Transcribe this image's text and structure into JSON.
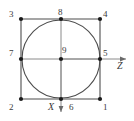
{
  "figure": {
    "colors": {
      "line": "#4d4d4d",
      "node": "#1a1a1a",
      "circle": "#4d4d4d",
      "text": "#3a3a3a",
      "background": "#ffffff"
    },
    "geometry": {
      "square": {
        "left": 21,
        "top": 19,
        "right": 100,
        "bottom": 99
      },
      "circle": {
        "cx": 61,
        "cy": 59,
        "r": 39
      },
      "center": {
        "x": 61,
        "y": 59
      }
    },
    "nodes": [
      {
        "id": "1",
        "label": "1",
        "x": 100,
        "y": 99,
        "label_x": 103,
        "label_y": 103
      },
      {
        "id": "2",
        "label": "2",
        "x": 21,
        "y": 99,
        "label_x": 9,
        "label_y": 103
      },
      {
        "id": "3",
        "label": "3",
        "x": 21,
        "y": 19,
        "label_x": 9,
        "label_y": 10
      },
      {
        "id": "4",
        "label": "4",
        "x": 100,
        "y": 19,
        "label_x": 103,
        "label_y": 10
      },
      {
        "id": "5",
        "label": "5",
        "x": 100,
        "y": 59,
        "label_x": 103,
        "label_y": 48
      },
      {
        "id": "6",
        "label": "6",
        "x": 61,
        "y": 99,
        "label_x": 69,
        "label_y": 103
      },
      {
        "id": "7",
        "label": "7",
        "x": 21,
        "y": 59,
        "label_x": 9,
        "label_y": 48
      },
      {
        "id": "8",
        "label": "8",
        "x": 61,
        "y": 19,
        "label_x": 58,
        "label_y": 8
      },
      {
        "id": "9",
        "label": "9",
        "x": 61,
        "y": 59,
        "label_x": 62,
        "label_y": 47
      }
    ],
    "axes": [
      {
        "id": "z",
        "label": "Z",
        "orientation": "horizontal",
        "from_x": 61,
        "from_y": 59,
        "to_x": 128,
        "to_y": 59,
        "label_x": 117,
        "label_y": 63
      },
      {
        "id": "x",
        "label": "X",
        "orientation": "vertical",
        "from_x": 61,
        "from_y": 59,
        "to_x": 61,
        "to_y": 114,
        "label_x": 48,
        "label_y": 104
      }
    ]
  }
}
